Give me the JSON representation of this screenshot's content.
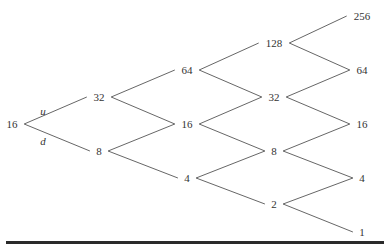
{
  "diagram": {
    "type": "binomial-tree",
    "edge_labels": {
      "up": "u",
      "down": "d"
    },
    "levels": [
      {
        "x": 12,
        "nodes": [
          {
            "value": "16",
            "y": 124
          }
        ]
      },
      {
        "x": 99,
        "nodes": [
          {
            "value": "32",
            "y": 97
          },
          {
            "value": "8",
            "y": 151
          }
        ]
      },
      {
        "x": 187,
        "nodes": [
          {
            "value": "64",
            "y": 70
          },
          {
            "value": "16",
            "y": 124
          },
          {
            "value": "4",
            "y": 178
          }
        ]
      },
      {
        "x": 274,
        "nodes": [
          {
            "value": "128",
            "y": 43
          },
          {
            "value": "32",
            "y": 97
          },
          {
            "value": "8",
            "y": 151
          },
          {
            "value": "2",
            "y": 204
          }
        ]
      },
      {
        "x": 362,
        "nodes": [
          {
            "value": "256",
            "y": 16
          },
          {
            "value": "64",
            "y": 70
          },
          {
            "value": "16",
            "y": 124
          },
          {
            "value": "4",
            "y": 178
          },
          {
            "value": "1",
            "y": 232
          }
        ]
      }
    ],
    "line_color": "#555555",
    "bar_color": "#2a2a2a"
  }
}
